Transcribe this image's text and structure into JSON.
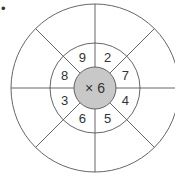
{
  "diagram": {
    "title_marker": "•",
    "center_label": "× 6",
    "operation": "multiply",
    "multiplier": 6,
    "inner_ring_numbers": [
      "9",
      "2",
      "7",
      "4",
      "5",
      "6",
      "3",
      "8"
    ],
    "outer_ring_answers": [
      "",
      "",
      "",
      "",
      "",
      "",
      "",
      ""
    ],
    "colors": {
      "line": "#555555",
      "center_fill": "#c8c8c8",
      "text": "#333333"
    }
  }
}
